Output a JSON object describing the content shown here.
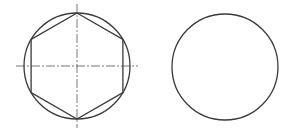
{
  "figure": {
    "width": 293,
    "height": 138,
    "background": "#ffffff",
    "stroke_color": "#3a3a3a",
    "centerline_color": "#555555",
    "views": [
      {
        "name": "front-view",
        "circle": {
          "cx": 77,
          "cy": 66,
          "r": 53
        },
        "hexagon": {
          "cx": 77,
          "cy": 66,
          "r": 53,
          "orientation": "vertex-up"
        },
        "centerlines": {
          "horizontal": {
            "x1": 16,
            "x2": 138,
            "y": 66
          },
          "vertical": {
            "x": 77,
            "y1": 4,
            "y2": 128
          }
        }
      },
      {
        "name": "side-view",
        "circle": {
          "cx": 225,
          "cy": 67,
          "r": 53
        }
      }
    ]
  }
}
